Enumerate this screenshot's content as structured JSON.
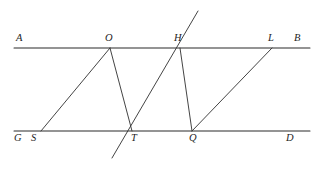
{
  "figure": {
    "type": "geometry-diagram",
    "width": 320,
    "height": 169,
    "background_color": "#ffffff",
    "stroke_color": "#2b2b2b",
    "label_color": "#1e1e1e"
  },
  "lines": {
    "top_parallel": {
      "name": "line-AB",
      "x1": 14,
      "y1": 48,
      "x2": 310,
      "y2": 48
    },
    "bottom_parallel": {
      "name": "line-GD",
      "x1": 14,
      "y1": 131,
      "x2": 310,
      "y2": 131
    },
    "transversal_TH": {
      "name": "transversal-through-T-and-H",
      "x1": 112,
      "y1": 158,
      "x2": 198,
      "y2": 11
    }
  },
  "segments": [
    {
      "name": "segment-S-O",
      "x1": 41,
      "y1": 131,
      "x2": 110,
      "y2": 48
    },
    {
      "name": "segment-O-T",
      "x1": 110,
      "y1": 48,
      "x2": 132,
      "y2": 131
    },
    {
      "name": "segment-H-Q",
      "x1": 180,
      "y1": 48,
      "x2": 192,
      "y2": 131
    },
    {
      "name": "segment-Q-L",
      "x1": 192,
      "y1": 131,
      "x2": 272,
      "y2": 48
    }
  ],
  "points": [
    {
      "id": "A",
      "label": "A",
      "label_x": 16,
      "label_y": 33,
      "on": "top_parallel"
    },
    {
      "id": "O",
      "label": "O",
      "label_x": 105,
      "label_y": 33,
      "on": "top_parallel"
    },
    {
      "id": "H",
      "label": "H",
      "label_x": 174,
      "label_y": 33,
      "on": "top_parallel"
    },
    {
      "id": "L",
      "label": "L",
      "label_x": 268,
      "label_y": 33,
      "on": "top_parallel"
    },
    {
      "id": "B",
      "label": "B",
      "label_x": 294,
      "label_y": 33,
      "on": "top_parallel"
    },
    {
      "id": "G",
      "label": "G",
      "label_x": 14,
      "label_y": 133,
      "on": "bottom_parallel"
    },
    {
      "id": "S",
      "label": "S",
      "label_x": 31,
      "label_y": 133,
      "on": "bottom_parallel"
    },
    {
      "id": "T",
      "label": "T",
      "label_x": 131,
      "label_y": 133,
      "on": "bottom_parallel"
    },
    {
      "id": "Q",
      "label": "Q",
      "label_x": 189,
      "label_y": 133,
      "on": "bottom_parallel"
    },
    {
      "id": "D",
      "label": "D",
      "label_x": 286,
      "label_y": 133,
      "on": "bottom_parallel"
    }
  ]
}
